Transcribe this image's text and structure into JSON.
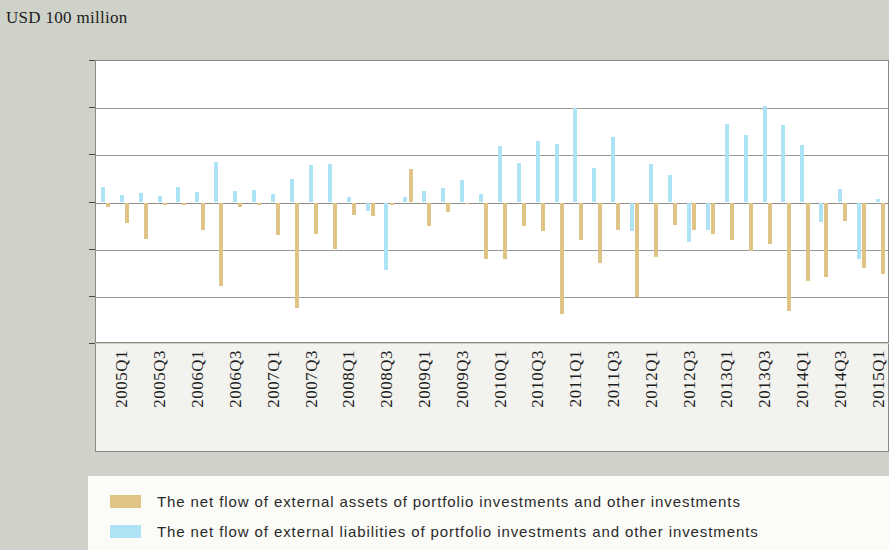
{
  "unit_caption": "USD 100 million",
  "legend": {
    "position": "bottom",
    "items": [
      {
        "key": "assets",
        "color": "#dfc486",
        "label": "The net flow of external assets of portfolio investments and other investments"
      },
      {
        "key": "liabilities",
        "color": "#ade3f5",
        "label": "The net flow of external liabilities of portfolio investments and other investments"
      }
    ]
  },
  "chart_data": {
    "type": "bar",
    "title": "",
    "subtitle": "",
    "xlabel": "",
    "ylabel": "USD 100 million",
    "ylim": [
      -1500,
      1500
    ],
    "ytick_labels": [
      "1 500",
      "1 000",
      "500",
      "0",
      "−500",
      "−1 000",
      "−1 500"
    ],
    "ytick_values": [
      1500,
      1000,
      500,
      0,
      -500,
      -1000,
      -1500
    ],
    "grid": true,
    "grid_axis": "y",
    "tick_label_rotation": -90,
    "tick_label_interval": 2,
    "categories": [
      "2005Q1",
      "2005Q2",
      "2005Q3",
      "2005Q4",
      "2006Q1",
      "2006Q2",
      "2006Q3",
      "2006Q4",
      "2007Q1",
      "2007Q2",
      "2007Q3",
      "2007Q4",
      "2008Q1",
      "2008Q2",
      "2008Q3",
      "2008Q4",
      "2009Q1",
      "2009Q2",
      "2009Q3",
      "2009Q4",
      "2010Q1",
      "2010Q2",
      "2010Q3",
      "2010Q4",
      "2011Q1",
      "2011Q2",
      "2011Q3",
      "2011Q4",
      "2012Q1",
      "2012Q2",
      "2012Q3",
      "2012Q4",
      "2013Q1",
      "2013Q2",
      "2013Q3",
      "2013Q4",
      "2014Q1",
      "2014Q2",
      "2014Q3",
      "2014Q4",
      "2015Q1",
      "2015Q2"
    ],
    "visible_tick_labels": [
      "2005Q1",
      "2005Q3",
      "2006Q1",
      "2006Q3",
      "2007Q1",
      "2007Q3",
      "2008Q1",
      "2008Q3",
      "2009Q1",
      "2009Q3",
      "2010Q1",
      "2010Q3",
      "2011Q1",
      "2011Q3",
      "2012Q1",
      "2012Q3",
      "2013Q1",
      "2013Q3",
      "2014Q1",
      "2014Q3",
      "2015Q1"
    ],
    "series": [
      {
        "name": "The net flow of external assets of portfolio investments and other investments",
        "key": "assets",
        "color": "#dfc486",
        "values": [
          -45,
          -220,
          -390,
          -30,
          -25,
          -295,
          -885,
          -50,
          -30,
          -340,
          -1120,
          -330,
          -490,
          -130,
          -140,
          -25,
          350,
          -250,
          -105,
          -20,
          -600,
          -595,
          -250,
          -300,
          -1180,
          -395,
          -640,
          -295,
          -1000,
          -580,
          -235,
          -290,
          -330,
          -400,
          -510,
          -445,
          -1150,
          -830,
          -790,
          -200,
          -690,
          -760
        ]
      },
      {
        "name": "The net flow of external liabilities of portfolio investments and other investments",
        "key": "liabilities",
        "color": "#ade3f5",
        "values": [
          160,
          80,
          105,
          70,
          160,
          115,
          430,
          120,
          135,
          85,
          250,
          400,
          405,
          55,
          -90,
          -720,
          60,
          125,
          150,
          235,
          95,
          595,
          415,
          650,
          625,
          1000,
          370,
          690,
          -300,
          410,
          290,
          -420,
          -290,
          830,
          715,
          1020,
          820,
          605,
          -210,
          145,
          -600,
          40
        ]
      }
    ]
  }
}
